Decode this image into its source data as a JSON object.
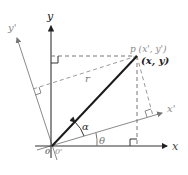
{
  "diagram": {
    "labels": {
      "y_axis": "y",
      "x_axis": "x",
      "y_prime_axis": "y'",
      "x_prime_axis": "x'",
      "point_primed": "p (x', y')",
      "point_original": "(x, y)",
      "radius": "r",
      "alpha": "α",
      "theta": "θ",
      "origin": "0",
      "origin_prime": "0'"
    },
    "colors": {
      "axis_original": "#333333",
      "axis_rotated": "#888888",
      "radius_line": "#1a1a1a",
      "dashed": "#777777",
      "text_dark": "#222222",
      "text_gray": "#888888"
    }
  }
}
